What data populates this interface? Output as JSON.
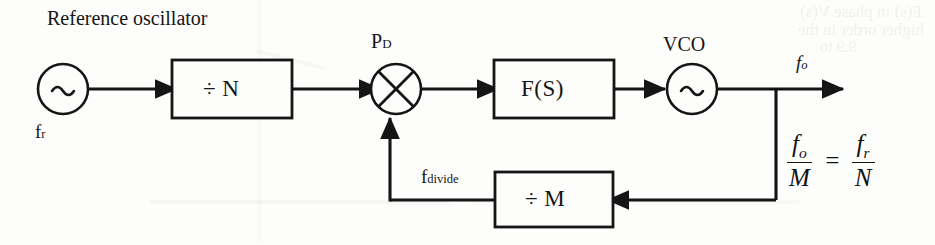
{
  "figure": {
    "type": "block-diagram",
    "width": 935,
    "height": 245,
    "background_color": "#fdfdfc",
    "line_color": "#151515"
  },
  "annotations": {
    "title": "Reference oscillator"
  },
  "blocks": {
    "reference_oscillator": {
      "shape": "circle",
      "symbol": "~",
      "label_below": "f",
      "label_below_sub": "r"
    },
    "divide_n": {
      "shape": "rectangle",
      "label": "÷ N"
    },
    "phase_detector": {
      "shape": "circle-with-x",
      "name": "P",
      "name_sub": "D"
    },
    "loop_filter": {
      "shape": "rectangle",
      "label": "F(S)"
    },
    "vco": {
      "shape": "circle",
      "symbol": "~",
      "name": "VCO"
    },
    "divide_m": {
      "shape": "rectangle",
      "label": "÷ M"
    }
  },
  "signals": {
    "output": {
      "name": "f",
      "name_sub": "o"
    },
    "feedback": {
      "name": "f",
      "name_sub": "divide"
    }
  },
  "equation": {
    "numerator_left": "f",
    "numerator_left_sub": "o",
    "denominator_left": "M",
    "operator": "=",
    "numerator_right": "f",
    "numerator_right_sub": "r",
    "denominator_right": "N"
  },
  "icons": {
    "sine_wave": "~",
    "division": "÷",
    "arrow": "▶"
  }
}
